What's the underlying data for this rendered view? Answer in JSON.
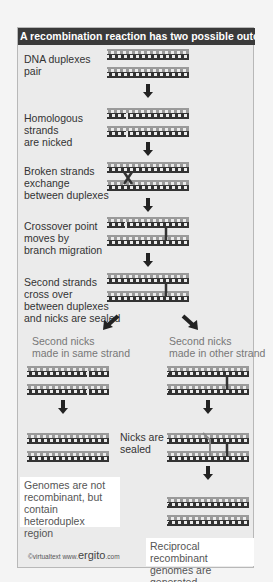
{
  "title": "A recombination reaction has two possible outcomes",
  "steps": [
    {
      "label": "DNA duplexes\npair"
    },
    {
      "label": "Homologous\nstrands\nare nicked"
    },
    {
      "label": "Broken strands\nexchange\nbetween duplexes"
    },
    {
      "label": "Crossover point\nmoves by\nbranch migration"
    },
    {
      "label": "Second strands\ncross over\nbetween duplexes\nand nicks are sealed"
    }
  ],
  "branches": {
    "left": {
      "label": "Second nicks\nmade in same strand",
      "outcome": "Genomes are not\nrecombinant, but\ncontain heteroduplex\nregion"
    },
    "middle_label": "Nicks are\nsealed",
    "right": {
      "label": "Second nicks\nmade in other strand",
      "outcome": "Reciprocal recombinant\ngenomes are generated"
    }
  },
  "credit": {
    "prefix": "©virtualtext  www.",
    "brand": "ergito",
    "suffix": ".com"
  },
  "colors": {
    "title_bg": "#3a3a3a",
    "panel_bg": "#ebebeb",
    "strand_light": "#9a9a9a",
    "strand_dark": "#333333",
    "arrow": "#222222"
  }
}
